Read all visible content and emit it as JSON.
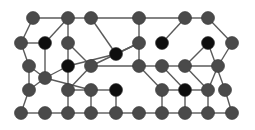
{
  "colors": {
    "background": "#ffffff",
    "edge": "#5a5a5a",
    "node_gray": "#4a4a4a",
    "node_black": "#0e0e0e"
  },
  "node_radius": 6.5,
  "nodes": [
    {
      "id": "a1",
      "x": 33,
      "y": 18,
      "type": "gray"
    },
    {
      "id": "a2",
      "x": 68,
      "y": 18,
      "type": "gray"
    },
    {
      "id": "a3",
      "x": 91,
      "y": 18,
      "type": "gray"
    },
    {
      "id": "a4",
      "x": 139,
      "y": 18,
      "type": "gray"
    },
    {
      "id": "a5",
      "x": 185,
      "y": 18,
      "type": "gray"
    },
    {
      "id": "a6",
      "x": 208,
      "y": 18,
      "type": "gray"
    },
    {
      "id": "b1",
      "x": 21,
      "y": 43,
      "type": "gray"
    },
    {
      "id": "b2",
      "x": 45,
      "y": 43,
      "type": "black"
    },
    {
      "id": "b3",
      "x": 68,
      "y": 43,
      "type": "gray"
    },
    {
      "id": "b4",
      "x": 116,
      "y": 54,
      "type": "black"
    },
    {
      "id": "b5",
      "x": 139,
      "y": 43,
      "type": "gray"
    },
    {
      "id": "b6",
      "x": 162,
      "y": 43,
      "type": "black"
    },
    {
      "id": "b7",
      "x": 208,
      "y": 43,
      "type": "black"
    },
    {
      "id": "b8",
      "x": 232,
      "y": 43,
      "type": "gray"
    },
    {
      "id": "c1",
      "x": 29,
      "y": 66,
      "type": "gray"
    },
    {
      "id": "c2",
      "x": 68,
      "y": 66,
      "type": "black"
    },
    {
      "id": "c3",
      "x": 91,
      "y": 66,
      "type": "gray"
    },
    {
      "id": "c4",
      "x": 139,
      "y": 66,
      "type": "gray"
    },
    {
      "id": "c5",
      "x": 162,
      "y": 66,
      "type": "gray"
    },
    {
      "id": "c6",
      "x": 185,
      "y": 66,
      "type": "gray"
    },
    {
      "id": "c7",
      "x": 218,
      "y": 66,
      "type": "gray"
    },
    {
      "id": "c8",
      "x": 45,
      "y": 78,
      "type": "gray"
    },
    {
      "id": "d1",
      "x": 29,
      "y": 90,
      "type": "gray"
    },
    {
      "id": "d2",
      "x": 68,
      "y": 90,
      "type": "gray"
    },
    {
      "id": "d3",
      "x": 91,
      "y": 90,
      "type": "gray"
    },
    {
      "id": "d4",
      "x": 116,
      "y": 90,
      "type": "black"
    },
    {
      "id": "d5",
      "x": 162,
      "y": 90,
      "type": "gray"
    },
    {
      "id": "d6",
      "x": 185,
      "y": 90,
      "type": "black"
    },
    {
      "id": "d7",
      "x": 208,
      "y": 90,
      "type": "gray"
    },
    {
      "id": "d8",
      "x": 225,
      "y": 90,
      "type": "gray"
    },
    {
      "id": "e1",
      "x": 21,
      "y": 113,
      "type": "gray"
    },
    {
      "id": "e2",
      "x": 45,
      "y": 113,
      "type": "gray"
    },
    {
      "id": "e3",
      "x": 68,
      "y": 113,
      "type": "gray"
    },
    {
      "id": "e4",
      "x": 91,
      "y": 113,
      "type": "gray"
    },
    {
      "id": "e5",
      "x": 116,
      "y": 113,
      "type": "gray"
    },
    {
      "id": "e6",
      "x": 139,
      "y": 113,
      "type": "gray"
    },
    {
      "id": "e7",
      "x": 162,
      "y": 113,
      "type": "gray"
    },
    {
      "id": "e8",
      "x": 185,
      "y": 113,
      "type": "gray"
    },
    {
      "id": "e9",
      "x": 208,
      "y": 113,
      "type": "gray"
    },
    {
      "id": "e10",
      "x": 232,
      "y": 113,
      "type": "gray"
    }
  ],
  "edges": [
    [
      "a1",
      "a2"
    ],
    [
      "a2",
      "a3"
    ],
    [
      "a3",
      "a4"
    ],
    [
      "a4",
      "a5"
    ],
    [
      "a5",
      "a6"
    ],
    [
      "a1",
      "b1"
    ],
    [
      "b1",
      "b2"
    ],
    [
      "a2",
      "b2"
    ],
    [
      "a2",
      "b3"
    ],
    [
      "a3",
      "b4"
    ],
    [
      "b4",
      "b5"
    ],
    [
      "a4",
      "b5"
    ],
    [
      "a5",
      "b6"
    ],
    [
      "a6",
      "b8"
    ],
    [
      "b2",
      "c8"
    ],
    [
      "b1",
      "c1"
    ],
    [
      "c1",
      "c8"
    ],
    [
      "c8",
      "d1"
    ],
    [
      "c1",
      "d1"
    ],
    [
      "b3",
      "c3"
    ],
    [
      "b3",
      "c2"
    ],
    [
      "c2",
      "c8"
    ],
    [
      "c2",
      "b4"
    ],
    [
      "c3",
      "c4"
    ],
    [
      "c3",
      "b5"
    ],
    [
      "b5",
      "c4"
    ],
    [
      "c4",
      "c5"
    ],
    [
      "c5",
      "c6"
    ],
    [
      "c6",
      "c7"
    ],
    [
      "b7",
      "c6"
    ],
    [
      "b7",
      "d8"
    ],
    [
      "b8",
      "c7"
    ],
    [
      "c7",
      "d7"
    ],
    [
      "c8",
      "d3"
    ],
    [
      "d3",
      "d4"
    ],
    [
      "d2",
      "d3"
    ],
    [
      "c4",
      "d5"
    ],
    [
      "c5",
      "d6"
    ],
    [
      "d5",
      "d6"
    ],
    [
      "d6",
      "d7"
    ],
    [
      "c6",
      "d7"
    ],
    [
      "d1",
      "e1"
    ],
    [
      "d2",
      "e3"
    ],
    [
      "d3",
      "e4"
    ],
    [
      "d4",
      "e5"
    ],
    [
      "d5",
      "e7"
    ],
    [
      "d6",
      "e8"
    ],
    [
      "d7",
      "e9"
    ],
    [
      "d8",
      "e10"
    ],
    [
      "e1",
      "e2"
    ],
    [
      "e2",
      "e3"
    ],
    [
      "e3",
      "e4"
    ],
    [
      "e4",
      "e5"
    ],
    [
      "e5",
      "e6"
    ],
    [
      "e6",
      "e7"
    ],
    [
      "e7",
      "e8"
    ],
    [
      "e8",
      "e9"
    ],
    [
      "e9",
      "e10"
    ],
    [
      "c3",
      "d2"
    ],
    [
      "c2",
      "d2"
    ]
  ]
}
